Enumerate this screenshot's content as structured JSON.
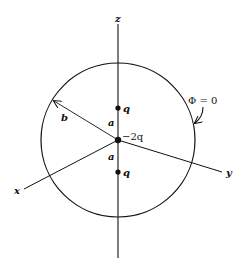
{
  "figure": {
    "axes": {
      "z_label": "z",
      "x_label": "x",
      "y_label": "y"
    },
    "sphere": {
      "radius_label": "b",
      "potential_label": "Φ = 0"
    },
    "charges": [
      {
        "label": "q",
        "position": "top"
      },
      {
        "label": "−2q",
        "position": "center"
      },
      {
        "label": "q",
        "position": "bottom"
      }
    ],
    "distances": [
      {
        "label": "a",
        "between": "top-q and center"
      },
      {
        "label": "a",
        "between": "center and bottom-q"
      }
    ],
    "colors": {
      "ink": "#111111",
      "background": "#ffffff"
    }
  }
}
